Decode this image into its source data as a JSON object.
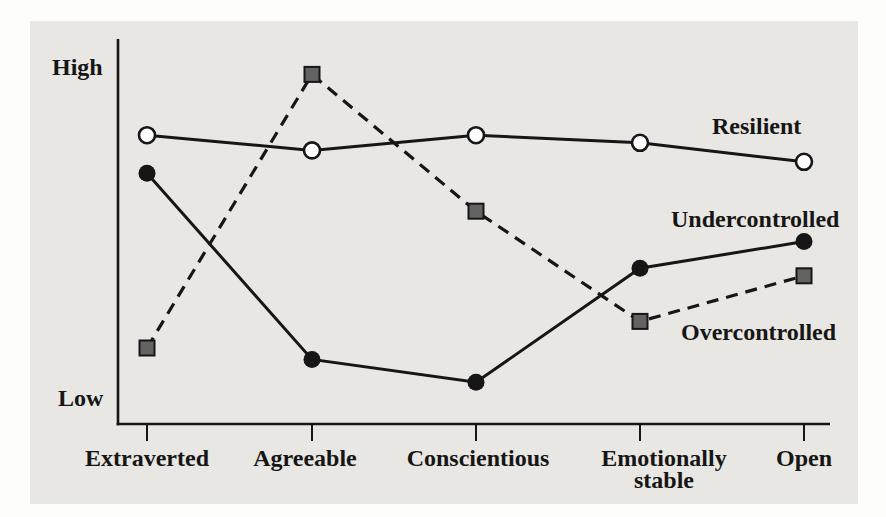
{
  "figure": {
    "type": "line-chart"
  },
  "y_axis": {
    "high_label": "High",
    "low_label": "Low"
  },
  "x_axis": {
    "categories": [
      {
        "line1": "Extraverted",
        "line2": ""
      },
      {
        "line1": "Agreeable",
        "line2": ""
      },
      {
        "line1": "Conscientious",
        "line2": ""
      },
      {
        "line1": "Emotionally",
        "line2": "stable"
      },
      {
        "line1": "Open",
        "line2": ""
      }
    ]
  },
  "series_labels": {
    "resilient": "Resilient",
    "undercontrolled": "Undercontrolled",
    "overcontrolled": "Overcontrolled"
  },
  "colors": {
    "page_bg": "#fdfdfc",
    "panel_bg": "#e9e7e3",
    "ink": "#161616",
    "open_circle_fill": "#ffffff",
    "square_fill": "#636363"
  },
  "chart_data": {
    "type": "line",
    "title": "",
    "xlabel": "",
    "ylabel": "",
    "categories": [
      "Extraverted",
      "Agreeable",
      "Conscientious",
      "Emotionally stable",
      "Open"
    ],
    "y_scale": {
      "type": "qualitative",
      "low_label": "Low",
      "high_label": "High",
      "value_range": [
        0,
        100
      ],
      "note": "values are relative positions between Low (0) and High (100), no numeric ticks shown"
    },
    "grid": false,
    "legend_position": "inline labels at right side of plot",
    "series": [
      {
        "name": "Resilient",
        "line": "solid",
        "marker": "open-circle",
        "values": [
          76,
          72,
          76,
          74,
          69
        ]
      },
      {
        "name": "Undercontrolled",
        "line": "solid",
        "marker": "filled-circle",
        "values": [
          66,
          17,
          11,
          41,
          48
        ]
      },
      {
        "name": "Overcontrolled",
        "line": "dashed",
        "marker": "filled-square",
        "values": [
          20,
          92,
          56,
          27,
          39
        ]
      }
    ]
  }
}
